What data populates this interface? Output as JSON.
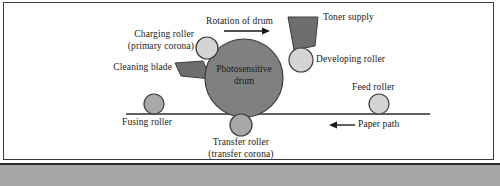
{
  "figure": {
    "background_color": "#ffffff",
    "border_color": "#3a3a3a",
    "footer_band_color": "#a6a6a6"
  },
  "colors": {
    "drum_fill": "#808080",
    "drum_stroke": "#3c3c3c",
    "light_roller_fill": "#d4d4d4",
    "mid_roller_fill": "#a8a8a8",
    "dark_part_fill": "#6e6e6e",
    "line_color": "#2b2b2b",
    "text_color": "#1a1a1a"
  },
  "labels": {
    "charging_roller_line1": "Charging roller",
    "charging_roller_line2": "(primary corona)",
    "cleaning_blade": "Cleaning blade",
    "rotation_of_drum": "Rotation of drum",
    "toner_supply": "Toner supply",
    "developing_roller": "Developing roller",
    "feed_roller": "Feed roller",
    "photosensitive_drum_line1": "Photosensitive",
    "photosensitive_drum_line2": "drum",
    "fusing_roller": "Fusing roller",
    "transfer_roller_line1": "Transfer roller",
    "transfer_roller_line2": "(transfer corona)",
    "paper_path": "Paper path"
  },
  "components": [
    {
      "name": "photosensitive-drum",
      "shape": "circle",
      "cx": 244,
      "cy": 78,
      "r": 39,
      "fill": "#808080"
    },
    {
      "name": "charging-roller",
      "shape": "circle",
      "cx": 207,
      "cy": 48,
      "r": 11,
      "fill": "#d4d4d4"
    },
    {
      "name": "developing-roller",
      "shape": "circle",
      "cx": 301,
      "cy": 60,
      "r": 12,
      "fill": "#d4d4d4"
    },
    {
      "name": "transfer-roller",
      "shape": "circle",
      "cx": 241,
      "cy": 125,
      "r": 11,
      "fill": "#a8a8a8"
    },
    {
      "name": "fusing-roller",
      "shape": "circle",
      "cx": 154,
      "cy": 104,
      "r": 10,
      "fill": "#a8a8a8"
    },
    {
      "name": "feed-roller",
      "shape": "circle",
      "cx": 379,
      "cy": 104,
      "r": 10,
      "fill": "#d4d4d4"
    },
    {
      "name": "toner-supply",
      "shape": "trapezoid",
      "fill": "#6e6e6e"
    },
    {
      "name": "cleaning-blade",
      "shape": "wedge",
      "fill": "#6e6e6e"
    }
  ],
  "arrows": {
    "rotation_direction": "right",
    "paper_path_direction": "left"
  },
  "paper_path_line": {
    "x1": 126,
    "y1": 114,
    "x2": 430,
    "y2": 114
  }
}
